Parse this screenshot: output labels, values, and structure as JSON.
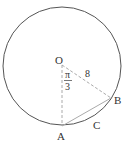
{
  "diagram": {
    "type": "circle-geometry",
    "circle": {
      "cx": 62,
      "cy": 66,
      "r": 59,
      "stroke": "#555555"
    },
    "points": {
      "O": {
        "label": "O",
        "x": 62,
        "y": 63
      },
      "A": {
        "label": "A",
        "x": 62,
        "y": 126
      },
      "B": {
        "label": "B",
        "x": 111,
        "y": 98
      },
      "C": {
        "label": "C"
      }
    },
    "angle_label": {
      "numerator": "π",
      "denominator": "3"
    },
    "radius_label": "8",
    "colors": {
      "dashed": "#aaaaaa",
      "chord": "#aaaaaa",
      "text": "#333333"
    }
  }
}
